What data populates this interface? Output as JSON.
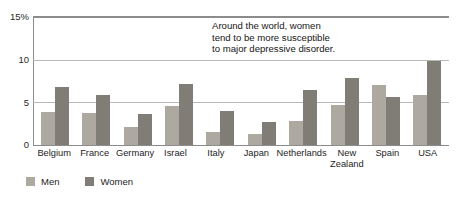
{
  "chart_data": {
    "type": "bar",
    "title": "",
    "subtitle": "",
    "xlabel": "",
    "ylabel": "",
    "ylim": [
      0,
      15
    ],
    "yticks": [
      "0",
      "5",
      "10",
      "15%"
    ],
    "grid": true,
    "legend_position": "bottom-left",
    "categories": [
      "Belgium",
      "France",
      "Germany",
      "Israel",
      "Italy",
      "Japan",
      "Netherlands",
      "New\nZealand",
      "Spain",
      "USA"
    ],
    "series": [
      {
        "name": "Men",
        "color": "#ada8a0",
        "values": [
          3.9,
          3.8,
          2.1,
          4.6,
          1.5,
          1.3,
          2.8,
          4.7,
          7.0,
          5.9
        ]
      },
      {
        "name": "Women",
        "color": "#807d77",
        "values": [
          6.8,
          5.9,
          3.6,
          7.2,
          4.0,
          2.7,
          6.4,
          7.9,
          5.6,
          9.8
        ]
      }
    ],
    "annotations": [
      {
        "text": "Around the world, women\ntend to be more susceptible\nto major depressive disorder."
      }
    ]
  },
  "axis": {
    "y": {
      "t15": "15%",
      "t10": "10",
      "t5": "5",
      "t0": "0"
    }
  },
  "legend": {
    "items": [
      {
        "label": "Men"
      },
      {
        "label": "Women"
      }
    ]
  },
  "colors": {
    "men": "#ada8a0",
    "women": "#807d77",
    "gridline": "#b9b9b9",
    "axis": "#8c8c8c",
    "background": "#ffffff",
    "text": "#1a1a1a"
  }
}
